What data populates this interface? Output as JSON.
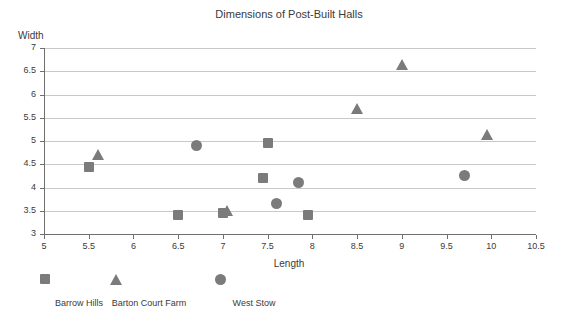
{
  "chart_data": {
    "type": "scatter",
    "title": "Dimensions of Post-Built Halls",
    "xlabel": "Length",
    "ylabel": "Width",
    "xlim": [
      5,
      10.5
    ],
    "ylim": [
      3,
      7
    ],
    "xticks": [
      "5",
      "5.5",
      "6",
      "6.5",
      "7",
      "7.5",
      "8",
      "8.5",
      "9",
      "9.5",
      "10",
      "10.5"
    ],
    "yticks": [
      "3",
      "3.5",
      "4",
      "4.5",
      "5",
      "5.5",
      "6",
      "6.5",
      "7"
    ],
    "grid": "horizontal",
    "legend_position": "bottom-left",
    "marker_color": "#7b7b7b",
    "series": [
      {
        "name": "Barrow Hills",
        "marker": "square",
        "points": [
          {
            "x": 5.5,
            "y": 4.45
          },
          {
            "x": 6.5,
            "y": 3.4
          },
          {
            "x": 7.0,
            "y": 3.45
          },
          {
            "x": 7.45,
            "y": 4.2
          },
          {
            "x": 7.5,
            "y": 4.95
          },
          {
            "x": 7.95,
            "y": 3.4
          }
        ]
      },
      {
        "name": "Barton Court Farm",
        "marker": "triangle",
        "points": [
          {
            "x": 5.6,
            "y": 4.7
          },
          {
            "x": 7.05,
            "y": 3.5
          },
          {
            "x": 8.5,
            "y": 5.7
          },
          {
            "x": 9.0,
            "y": 6.65
          },
          {
            "x": 9.95,
            "y": 5.15
          }
        ]
      },
      {
        "name": "West Stow",
        "marker": "circle",
        "points": [
          {
            "x": 6.7,
            "y": 4.9
          },
          {
            "x": 7.6,
            "y": 3.65
          },
          {
            "x": 7.85,
            "y": 4.1
          },
          {
            "x": 9.7,
            "y": 4.25
          }
        ]
      }
    ]
  }
}
